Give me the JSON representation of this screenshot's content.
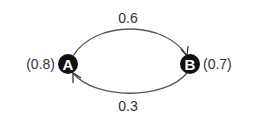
{
  "diagram": {
    "type": "markov-chain",
    "nodes": [
      {
        "id": "A",
        "label": "A",
        "value_label": "(0.8)"
      },
      {
        "id": "B",
        "label": "B",
        "value_label": "(0.7)"
      }
    ],
    "edges": [
      {
        "from": "A",
        "to": "B",
        "label": "0.6",
        "position": "top"
      },
      {
        "from": "B",
        "to": "A",
        "label": "0.3",
        "position": "bottom"
      }
    ],
    "colors": {
      "node_fill": "#111111",
      "node_text": "#ffffff",
      "edge": "#555555",
      "label": "#333333"
    }
  }
}
